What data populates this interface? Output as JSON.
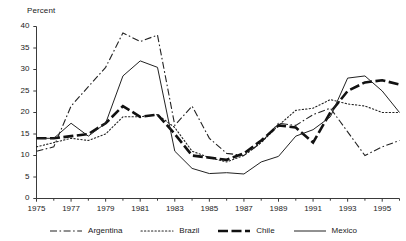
{
  "chart_data": {
    "type": "line",
    "title": "",
    "xlabel": "",
    "ylabel": "Percent",
    "xlim": [
      1975,
      1996
    ],
    "ylim": [
      0,
      40
    ],
    "grid": false,
    "legend_position": "bottom",
    "x": [
      1975,
      1976,
      1977,
      1978,
      1979,
      1980,
      1981,
      1982,
      1983,
      1984,
      1985,
      1986,
      1987,
      1988,
      1989,
      1990,
      1991,
      1992,
      1993,
      1994,
      1995,
      1996
    ],
    "ytick_labels": [
      "0",
      "5",
      "10",
      "15",
      "20",
      "25",
      "30",
      "35",
      "40"
    ],
    "ytick_values": [
      0,
      5,
      10,
      15,
      20,
      25,
      30,
      35,
      40
    ],
    "xtick_labels": [
      "1975",
      "1977",
      "1979",
      "1981",
      "1983",
      "1985",
      "1987",
      "1989",
      "1991",
      "1993",
      "1995"
    ],
    "xtick_values": [
      1975,
      1977,
      1979,
      1981,
      1983,
      1985,
      1987,
      1989,
      1991,
      1993,
      1995
    ],
    "minor_xticks": [
      1976,
      1978,
      1980,
      1982,
      1984,
      1986,
      1988,
      1990,
      1992,
      1994,
      1996
    ],
    "series": [
      {
        "name": "Argentina",
        "style": "dashdot",
        "color": "#222222",
        "width": 1.1,
        "dash": "7,2.5,1.6,2.5",
        "values": [
          11,
          12,
          21.5,
          26,
          30.5,
          38.5,
          36.5,
          38,
          17,
          21.5,
          14,
          10.5,
          10,
          13,
          17.5,
          17,
          19.5,
          21,
          15.5,
          10,
          12,
          13.5
        ]
      },
      {
        "name": "Brazil",
        "style": "dotted",
        "color": "#222222",
        "width": 1.1,
        "dash": "1.3,2.2",
        "values": [
          12,
          13,
          14,
          13.5,
          15,
          19,
          19,
          19.5,
          16.5,
          11,
          9.5,
          8.5,
          10,
          13,
          17,
          20.5,
          21,
          23,
          22,
          21.5,
          20,
          20
        ]
      },
      {
        "name": "Chile",
        "style": "thick-dashed",
        "color": "#111111",
        "width": 2.6,
        "dash": "10,3.5",
        "values": [
          14,
          14,
          14.5,
          15,
          17.5,
          21.5,
          19,
          19.5,
          15,
          10,
          9.5,
          9,
          10.5,
          13.5,
          17,
          16.5,
          13,
          20,
          25,
          27,
          27.5,
          26.5
        ]
      },
      {
        "name": "Mexico",
        "style": "solid",
        "color": "#222222",
        "width": 1.0,
        "dash": "none",
        "values": [
          14,
          14,
          17.5,
          14.5,
          17.5,
          28.5,
          32,
          30.5,
          11,
          7,
          5.8,
          6,
          5.7,
          8.5,
          9.8,
          14.5,
          16,
          19,
          28,
          28.5,
          25,
          20
        ]
      }
    ]
  },
  "legend": {
    "items": [
      {
        "label": "Argentina"
      },
      {
        "label": "Brazil"
      },
      {
        "label": "Chile"
      },
      {
        "label": "Mexico"
      }
    ]
  }
}
